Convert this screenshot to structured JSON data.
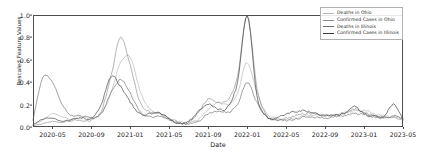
{
  "chart_data": {
    "type": "line",
    "title": "",
    "xlabel": "Date",
    "ylabel": "Rescaled Feature Values",
    "xlim": [
      "2020-03",
      "2023-05"
    ],
    "ylim": [
      0.0,
      1.0
    ],
    "grid": false,
    "legend_position": "upper right",
    "ytick_labels": [
      "0.0",
      "0.2",
      "0.4",
      "0.6",
      "0.8",
      "1.0"
    ],
    "ytick_values": [
      0.0,
      0.2,
      0.4,
      0.6,
      0.8,
      1.0
    ],
    "xtick_labels": [
      "2020-05",
      "2020-09",
      "2021-01",
      "2021-05",
      "2021-09",
      "2022-01",
      "2022-05",
      "2022-09",
      "2023-01",
      "2023-05"
    ],
    "xtick_values": [
      "2020-05",
      "2020-09",
      "2021-01",
      "2021-05",
      "2021-09",
      "2022-01",
      "2022-05",
      "2022-09",
      "2023-01",
      "2023-05"
    ],
    "colors": {
      "deaths_ohio": "#b4b4b4",
      "confirmed_ohio": "#8c8c8c",
      "deaths_illinois": "#6e6e6e",
      "confirmed_illinois": "#3a3a3a"
    },
    "series": [
      {
        "name": "Deaths in Ohio",
        "color": "#b4b4b4",
        "x": [
          "2020-03",
          "2020-04",
          "2020-05",
          "2020-06",
          "2020-07",
          "2020-08",
          "2020-09",
          "2020-10",
          "2020-11",
          "2020-12",
          "2021-01",
          "2021-02",
          "2021-03",
          "2021-04",
          "2021-05",
          "2021-06",
          "2021-07",
          "2021-08",
          "2021-09",
          "2021-10",
          "2021-11",
          "2021-12",
          "2022-01",
          "2022-02",
          "2022-03",
          "2022-04",
          "2022-05",
          "2022-06",
          "2022-07",
          "2022-08",
          "2022-09",
          "2022-10",
          "2022-11",
          "2022-12",
          "2023-01",
          "2023-02",
          "2023-03",
          "2023-04",
          "2023-05"
        ],
        "values": [
          0.02,
          0.06,
          0.12,
          0.09,
          0.07,
          0.09,
          0.08,
          0.12,
          0.3,
          0.58,
          0.62,
          0.32,
          0.16,
          0.12,
          0.08,
          0.05,
          0.04,
          0.07,
          0.16,
          0.22,
          0.2,
          0.3,
          0.58,
          0.3,
          0.12,
          0.08,
          0.07,
          0.08,
          0.1,
          0.11,
          0.1,
          0.11,
          0.13,
          0.14,
          0.15,
          0.12,
          0.1,
          0.09,
          0.08
        ]
      },
      {
        "name": "Confirmed Cases in Ohio",
        "color": "#8c8c8c",
        "x": [
          "2020-03",
          "2020-04",
          "2020-05",
          "2020-06",
          "2020-07",
          "2020-08",
          "2020-09",
          "2020-10",
          "2020-11",
          "2020-12",
          "2021-01",
          "2021-02",
          "2021-03",
          "2021-04",
          "2021-05",
          "2021-06",
          "2021-07",
          "2021-08",
          "2021-09",
          "2021-10",
          "2021-11",
          "2021-12",
          "2022-01",
          "2022-02",
          "2022-03",
          "2022-04",
          "2022-05",
          "2022-06",
          "2022-07",
          "2022-08",
          "2022-09",
          "2022-10",
          "2022-11",
          "2022-12",
          "2023-01",
          "2023-02",
          "2023-03",
          "2023-04",
          "2023-05"
        ],
        "values": [
          0.01,
          0.03,
          0.05,
          0.04,
          0.06,
          0.06,
          0.06,
          0.14,
          0.45,
          0.8,
          0.55,
          0.22,
          0.14,
          0.12,
          0.06,
          0.03,
          0.04,
          0.13,
          0.25,
          0.22,
          0.24,
          0.45,
          1.0,
          0.35,
          0.1,
          0.07,
          0.08,
          0.1,
          0.12,
          0.12,
          0.1,
          0.11,
          0.12,
          0.16,
          0.13,
          0.1,
          0.09,
          0.08,
          0.07
        ]
      },
      {
        "name": "Deaths in Illinois",
        "color": "#6e6e6e",
        "x": [
          "2020-03",
          "2020-04",
          "2020-05",
          "2020-06",
          "2020-07",
          "2020-08",
          "2020-09",
          "2020-10",
          "2020-11",
          "2020-12",
          "2021-01",
          "2021-02",
          "2021-03",
          "2021-04",
          "2021-05",
          "2021-06",
          "2021-07",
          "2021-08",
          "2021-09",
          "2021-10",
          "2021-11",
          "2021-12",
          "2022-01",
          "2022-02",
          "2022-03",
          "2022-04",
          "2022-05",
          "2022-06",
          "2022-07",
          "2022-08",
          "2022-09",
          "2022-10",
          "2022-11",
          "2022-12",
          "2023-01",
          "2023-02",
          "2023-03",
          "2023-04",
          "2023-05"
        ],
        "values": [
          0.06,
          0.44,
          0.4,
          0.2,
          0.1,
          0.1,
          0.08,
          0.12,
          0.3,
          0.42,
          0.3,
          0.14,
          0.09,
          0.1,
          0.07,
          0.04,
          0.03,
          0.05,
          0.12,
          0.14,
          0.13,
          0.2,
          0.4,
          0.22,
          0.09,
          0.06,
          0.06,
          0.07,
          0.09,
          0.09,
          0.08,
          0.09,
          0.1,
          0.12,
          0.11,
          0.09,
          0.08,
          0.1,
          0.07
        ]
      },
      {
        "name": "Confirmed Cases in Illinois",
        "color": "#3a3a3a",
        "x": [
          "2020-03",
          "2020-04",
          "2020-05",
          "2020-06",
          "2020-07",
          "2020-08",
          "2020-09",
          "2020-10",
          "2020-11",
          "2020-12",
          "2021-01",
          "2021-02",
          "2021-03",
          "2021-04",
          "2021-05",
          "2021-06",
          "2021-07",
          "2021-08",
          "2021-09",
          "2021-10",
          "2021-11",
          "2021-12",
          "2022-01",
          "2022-02",
          "2022-03",
          "2022-04",
          "2022-05",
          "2022-06",
          "2022-07",
          "2022-08",
          "2022-09",
          "2022-10",
          "2022-11",
          "2022-12",
          "2023-01",
          "2023-02",
          "2023-03",
          "2023-04",
          "2023-05"
        ],
        "values": [
          0.02,
          0.07,
          0.08,
          0.05,
          0.07,
          0.08,
          0.08,
          0.2,
          0.45,
          0.36,
          0.22,
          0.12,
          0.12,
          0.13,
          0.07,
          0.03,
          0.05,
          0.14,
          0.2,
          0.16,
          0.18,
          0.4,
          1.0,
          0.28,
          0.09,
          0.08,
          0.12,
          0.14,
          0.14,
          0.12,
          0.1,
          0.11,
          0.12,
          0.18,
          0.12,
          0.1,
          0.09,
          0.2,
          0.06
        ]
      }
    ]
  },
  "legend": {
    "items": [
      {
        "label": "Deaths in Ohio"
      },
      {
        "label": "Confirmed Cases in Ohio"
      },
      {
        "label": "Deaths in Illinois"
      },
      {
        "label": "Confirmed Cases in Illinois"
      }
    ]
  }
}
